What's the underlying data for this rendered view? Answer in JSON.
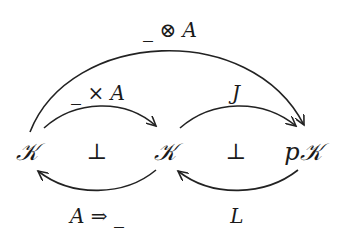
{
  "diagram": {
    "nodes": [
      {
        "id": "K1",
        "label": "𝒦",
        "x": 27,
        "y": 152
      },
      {
        "id": "K2",
        "label": "𝒦",
        "x": 165,
        "y": 152
      },
      {
        "id": "pK",
        "label": "p𝒦",
        "x": 303,
        "y": 152
      }
    ],
    "edges": [
      {
        "from": "K1",
        "to": "pK",
        "label": "_ ⊗ A",
        "direction": "forward",
        "position": "top-outer"
      },
      {
        "from": "K1",
        "to": "K2",
        "label": "_ × A",
        "direction": "forward",
        "position": "top"
      },
      {
        "from": "K2",
        "to": "pK",
        "label": "J",
        "direction": "forward",
        "position": "top"
      },
      {
        "from": "K2",
        "to": "K1",
        "label": "A ⇒ _",
        "direction": "backward",
        "position": "bottom"
      },
      {
        "from": "pK",
        "to": "K2",
        "label": "L",
        "direction": "backward",
        "position": "bottom"
      }
    ],
    "adjunctions": [
      {
        "between": [
          "K1",
          "K2"
        ],
        "symbol": "⊥",
        "x": 97,
        "y": 152
      },
      {
        "between": [
          "K2",
          "pK"
        ],
        "symbol": "⊥",
        "x": 236,
        "y": 152
      }
    ],
    "stroke_color": "#222222"
  }
}
